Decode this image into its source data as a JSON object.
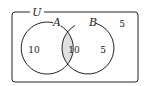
{
  "diagram": {
    "type": "venn",
    "universe": {
      "label": "U",
      "outside_count": "5"
    },
    "sets": [
      {
        "label": "A",
        "only_count": "10"
      },
      {
        "label": "B",
        "only_count": "5"
      }
    ],
    "intersection": {
      "count": "10",
      "shaded": true
    },
    "colors": {
      "stroke": "#222222",
      "intersection_fill": "#e0e0e0",
      "background": "#ffffff"
    }
  }
}
